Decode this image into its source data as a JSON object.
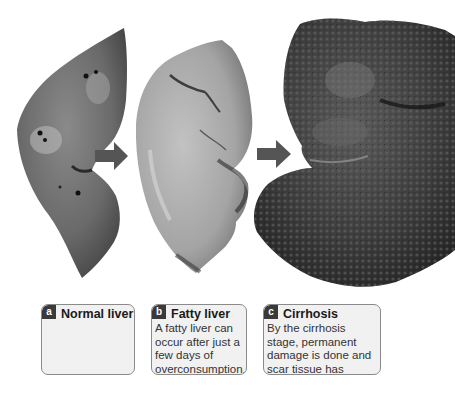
{
  "figure": {
    "panels": [
      {
        "id": "a",
        "badge": "a",
        "title": "Normal liver",
        "description": ""
      },
      {
        "id": "b",
        "badge": "b",
        "title": "Fatty liver",
        "description": "A fatty liver can occur after just a few days of overconsumption."
      },
      {
        "id": "c",
        "badge": "c",
        "title": "Cirrhosis",
        "description": "By the cirrhosis stage, permanent damage is done and scar tissue has developed."
      }
    ],
    "arrows": [
      {
        "from": "a",
        "to": "b"
      },
      {
        "from": "b",
        "to": "c"
      }
    ],
    "colors": {
      "arrow": "#555555",
      "badge": "#3a3a3a",
      "card_bg": "#f1f1f1",
      "card_border": "#8a8a8a",
      "normal_liver": "#6b6b6b",
      "fatty_liver": "#a9a9a9",
      "cirrhotic_liver": "#3c3c3c"
    }
  }
}
